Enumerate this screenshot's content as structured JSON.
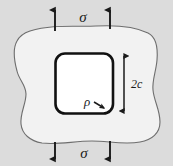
{
  "figure": {
    "type": "engineering-stress-diagram",
    "colors": {
      "background": "#dcdcdc",
      "plate_fill": "#f2f2f2",
      "plate_outline": "#6e6e6e",
      "hole_fill": "#ffffff",
      "hole_outline": "#111111",
      "label_color": "#1a1a1a",
      "arrow_color": "#1a1a1a"
    },
    "labels": {
      "stress_top": "σ",
      "stress_bottom": "σ",
      "hole_height": "2c",
      "corner_radius": "ρ"
    },
    "load_arrows": {
      "top": [
        {
          "name": "top-left-load-arrow",
          "x": 55,
          "y_tail": 30,
          "y_head": 8,
          "direction": "up"
        },
        {
          "name": "top-right-load-arrow",
          "x": 110,
          "y_tail": 30,
          "y_head": 8,
          "direction": "up"
        }
      ],
      "bottom": [
        {
          "name": "bottom-left-load-arrow",
          "x": 55,
          "y_tail": 138,
          "y_head": 160,
          "direction": "down"
        },
        {
          "name": "bottom-right-load-arrow",
          "x": 110,
          "y_tail": 138,
          "y_head": 160,
          "direction": "down"
        }
      ]
    },
    "dimension": {
      "name": "hole-height-dimension",
      "x": 124,
      "y_top": 53,
      "y_bottom": 114,
      "label": "2c",
      "label_x": 131,
      "label_y": 88
    },
    "hole": {
      "x": 55,
      "y": 53,
      "width": 58,
      "height": 60,
      "corner_radius": 9
    },
    "rho_pointer": {
      "label_x": 87,
      "label_y": 106,
      "arrow_from": [
        96,
        101
      ],
      "arrow_to": [
        106,
        108
      ]
    }
  }
}
